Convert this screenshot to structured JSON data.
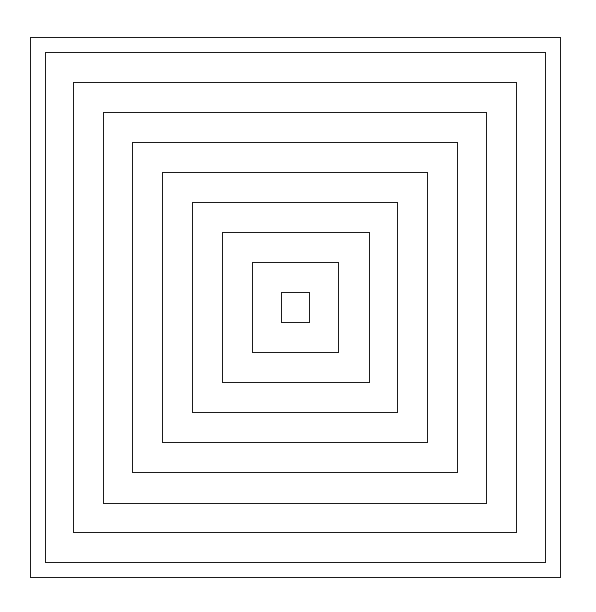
{
  "diagram": {
    "type": "nested-concentric-squares",
    "stroke_color": "#1a1a1a",
    "background": "#ffffff",
    "squares": [
      {
        "left": 30,
        "top": 37,
        "right": 561,
        "bottom": 578
      },
      {
        "left": 45,
        "top": 52,
        "right": 546,
        "bottom": 563
      },
      {
        "left": 73,
        "top": 82,
        "right": 517,
        "bottom": 533
      },
      {
        "left": 103,
        "top": 112,
        "right": 487,
        "bottom": 504
      },
      {
        "left": 132,
        "top": 142,
        "right": 458,
        "bottom": 473
      },
      {
        "left": 162,
        "top": 172,
        "right": 428,
        "bottom": 443
      },
      {
        "left": 192,
        "top": 202,
        "right": 398,
        "bottom": 413
      },
      {
        "left": 222,
        "top": 232,
        "right": 370,
        "bottom": 383
      },
      {
        "left": 252,
        "top": 262,
        "right": 339,
        "bottom": 353
      },
      {
        "left": 281,
        "top": 292,
        "right": 310,
        "bottom": 323
      }
    ]
  }
}
